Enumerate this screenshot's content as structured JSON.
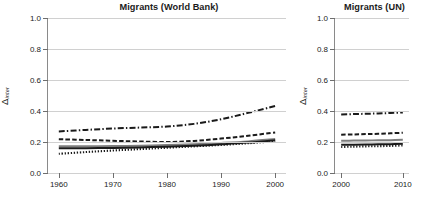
{
  "figure": {
    "ylabel_delta": "Δ",
    "ylabel_sub": "inter"
  },
  "chart_data": [
    {
      "type": "line",
      "title": "Migrants (World Bank)",
      "xlabel": "",
      "ylabel": "Δinter",
      "xlim": [
        1958,
        2002
      ],
      "ylim": [
        0.0,
        1.0
      ],
      "grid": true,
      "legend": "none",
      "xticks": [
        1960,
        1970,
        1980,
        1990,
        2000
      ],
      "xtick_labels": [
        "1960",
        "1970",
        "1980",
        "1990",
        "2000"
      ],
      "yticks": [
        0.0,
        0.2,
        0.4,
        0.6,
        0.8,
        1.0
      ],
      "ytick_labels": [
        "0.0",
        "0.2",
        "0.4",
        "0.6",
        "0.8",
        "1.0"
      ],
      "x": [
        1960,
        1965,
        1970,
        1975,
        1980,
        1985,
        1990,
        1995,
        2000
      ],
      "series": [
        {
          "name": "series-dashdot",
          "style": "dash-dot",
          "color": "#1a1a1a",
          "values": [
            0.268,
            0.278,
            0.287,
            0.293,
            0.3,
            0.317,
            0.347,
            0.388,
            0.432
          ]
        },
        {
          "name": "series-dashed",
          "style": "dashed",
          "color": "#1a1a1a",
          "values": [
            0.218,
            0.213,
            0.208,
            0.203,
            0.2,
            0.207,
            0.222,
            0.24,
            0.262
          ]
        },
        {
          "name": "series-solid-gray",
          "style": "solid",
          "color": "#7d7d7d",
          "values": [
            0.172,
            0.172,
            0.174,
            0.176,
            0.18,
            0.186,
            0.194,
            0.204,
            0.219
          ]
        },
        {
          "name": "series-solid-black",
          "style": "solid",
          "color": "#1a1a1a",
          "values": [
            0.16,
            0.16,
            0.162,
            0.165,
            0.17,
            0.176,
            0.185,
            0.196,
            0.212
          ]
        },
        {
          "name": "series-dotted",
          "style": "dotted",
          "color": "#1a1a1a",
          "values": [
            0.124,
            0.135,
            0.145,
            0.154,
            0.163,
            0.172,
            0.181,
            0.192,
            0.205
          ]
        }
      ]
    },
    {
      "type": "line",
      "title": "Migrants (UN)",
      "xlabel": "",
      "ylabel": "Δinter",
      "xlim": [
        1999,
        2011
      ],
      "ylim": [
        0.0,
        1.0
      ],
      "grid": true,
      "legend": "none",
      "xticks": [
        2000,
        2010
      ],
      "xtick_labels": [
        "2000",
        "2010"
      ],
      "yticks": [
        0.0,
        0.2,
        0.4,
        0.6,
        0.8,
        1.0
      ],
      "ytick_labels": [
        "0.0",
        "0.2",
        "0.4",
        "0.6",
        "0.8",
        "1.0"
      ],
      "x": [
        2000,
        2002,
        2004,
        2006,
        2008,
        2010
      ],
      "series": [
        {
          "name": "series-dashdot",
          "style": "dash-dot",
          "color": "#1a1a1a",
          "values": [
            0.378,
            0.38,
            0.382,
            0.384,
            0.387,
            0.391
          ]
        },
        {
          "name": "series-dashed",
          "style": "dashed",
          "color": "#1a1a1a",
          "values": [
            0.247,
            0.249,
            0.251,
            0.253,
            0.256,
            0.26
          ]
        },
        {
          "name": "series-solid-gray",
          "style": "solid",
          "color": "#7d7d7d",
          "values": [
            0.208,
            0.209,
            0.21,
            0.211,
            0.212,
            0.214
          ]
        },
        {
          "name": "series-solid-black",
          "style": "solid",
          "color": "#1a1a1a",
          "values": [
            0.182,
            0.183,
            0.184,
            0.185,
            0.186,
            0.188
          ]
        },
        {
          "name": "series-dotted",
          "style": "dotted",
          "color": "#1a1a1a",
          "values": [
            0.168,
            0.17,
            0.172,
            0.173,
            0.175,
            0.178
          ]
        }
      ]
    }
  ]
}
